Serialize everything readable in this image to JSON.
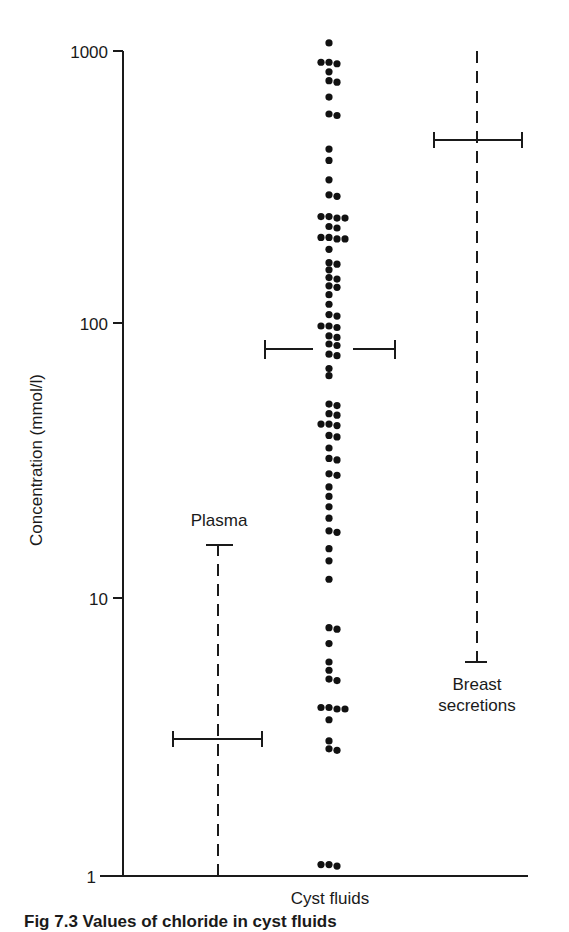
{
  "chart_data": {
    "type": "scatter",
    "title": "",
    "ylabel": "Concentration (mmol/l)",
    "xlabel": "",
    "yscale": "log",
    "ylim": [
      1,
      1000
    ],
    "yticks": [
      1,
      10,
      100,
      1000
    ],
    "ytick_labels": [
      "1",
      "10",
      "100",
      "1000"
    ],
    "grid": false,
    "legend": null,
    "categories": [
      "Plasma",
      "Cyst fluids",
      "Breast secretions"
    ],
    "series": [
      {
        "name": "Plasma",
        "style": "dashed range with mean bar",
        "range": [
          1,
          15.5
        ],
        "mean": 3.1,
        "label_position": "above"
      },
      {
        "name": "Cyst fluids",
        "style": "individual points with mean bar",
        "mean": 82,
        "label_position": "below axis",
        "points": [
          1070,
          910,
          780,
          840,
          740,
          680,
          930,
          870,
          590,
          590,
          440,
          400,
          340,
          300,
          300,
          250,
          230,
          260,
          240,
          240,
          220,
          210,
          210,
          210,
          210,
          190,
          170,
          170,
          160,
          150,
          140,
          130,
          140,
          150,
          120,
          110,
          110,
          100,
          100,
          96,
          92,
          88,
          86,
          82,
          79,
          76,
          70,
          66,
          52,
          52,
          48,
          46,
          44,
          43,
          42,
          40,
          38,
          36,
          33,
          33,
          29,
          28,
          26,
          24,
          22,
          20,
          18,
          18,
          15.5,
          14,
          12,
          8,
          8,
          7,
          6,
          5.6,
          5.2,
          5,
          4.1,
          4.1,
          4.1,
          4.1,
          3.7,
          3.1,
          2.9,
          2.9,
          1.1,
          1.1,
          1.1
        ]
      },
      {
        "name": "Breast secretions",
        "style": "dashed range with mean bar",
        "range": [
          5.8,
          1000
        ],
        "mean": 480,
        "label_lines": [
          "Breast",
          "secretions"
        ],
        "label_position": "below"
      }
    ],
    "annotations": [
      "Plasma",
      "Breast secretions"
    ],
    "x_category_label": "Cyst fluids"
  },
  "labels": {
    "y_axis_title": "Concentration (mmol/l)",
    "plasma": "Plasma",
    "breast_line1": "Breast",
    "breast_line2": "secretions",
    "cyst_fluids": "Cyst fluids",
    "ticks": [
      "1000",
      "100",
      "10",
      "1"
    ]
  },
  "caption": "Fig 7.3  Values of chloride in cyst fluids"
}
